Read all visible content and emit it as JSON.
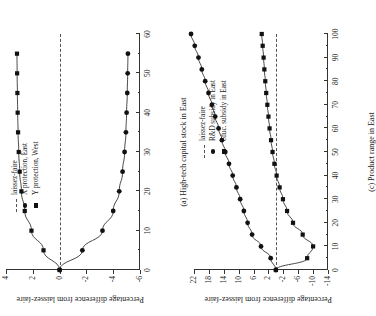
{
  "figure": {
    "shared_ylabel": "Percentage difference from laissez-faire"
  },
  "chart_data": [
    {
      "type": "line",
      "panel": "a",
      "title": "(a) High-tech capital stock in East",
      "xlabel": "(a) High-tech capital stock in East",
      "ylabel": "Percentage difference from laissez-faire",
      "xlim": [
        0,
        60
      ],
      "ylim": [
        -6,
        4
      ],
      "xticks": [
        0,
        10,
        20,
        30,
        40,
        50,
        60
      ],
      "xticklabels": [
        "0",
        "10",
        "20",
        "30",
        "40",
        "50",
        "60"
      ],
      "xminor_step": 5,
      "yticks": [
        -6,
        -4,
        -2,
        0,
        2,
        4
      ],
      "yticklabels": [
        "-6",
        "-4",
        "-2",
        "0",
        "2",
        "4"
      ],
      "grid": false,
      "legend_position": "upper-right-inside",
      "reference_line": {
        "label": "laissez-faire",
        "y": 0,
        "style": "dashed"
      },
      "series": [
        {
          "name": "X protection, East",
          "marker": "circle",
          "x": [
            0,
            5,
            10,
            15,
            20,
            25,
            30,
            35,
            40,
            45,
            50,
            55
          ],
          "y": [
            0.0,
            -1.7,
            -3.2,
            -4.0,
            -4.45,
            -4.7,
            -4.85,
            -4.95,
            -5.0,
            -5.05,
            -5.08,
            -5.1
          ]
        },
        {
          "name": "Y protection, West",
          "marker": "square",
          "x": [
            0,
            5,
            10,
            15,
            20,
            25,
            30,
            35,
            40,
            45,
            50,
            55
          ],
          "y": [
            0.0,
            1.2,
            2.1,
            2.6,
            2.85,
            2.98,
            3.05,
            3.1,
            3.13,
            3.15,
            3.17,
            3.18
          ]
        }
      ]
    },
    {
      "type": "line",
      "panel": "c",
      "title": "(c) Product range in East",
      "xlabel": "(c) Product range in East",
      "ylabel": "Percentage difference from laissez-faire",
      "xlim": [
        0,
        100
      ],
      "ylim": [
        -14,
        22
      ],
      "xticks": [
        0,
        10,
        20,
        30,
        40,
        50,
        60,
        70,
        80,
        90,
        100
      ],
      "xticklabels": [
        "0",
        "10",
        "20",
        "30",
        "40",
        "50",
        "60",
        "70",
        "80",
        "90",
        "100"
      ],
      "xminor_step": 5,
      "yticks": [
        -14,
        -10,
        -6,
        -2,
        2,
        6,
        10,
        14,
        18,
        22
      ],
      "yticklabels": [
        "-14",
        "-10",
        "-6",
        "-2",
        "2",
        "6",
        "10",
        "14",
        "18",
        "22"
      ],
      "grid": false,
      "legend_position": "upper-right-inside",
      "reference_line": {
        "label": "laissez-faire",
        "y": 0,
        "style": "dashed"
      },
      "series": [
        {
          "name": "R&D subsidy in East",
          "marker": "circle",
          "x": [
            0,
            5,
            10,
            15,
            20,
            25,
            30,
            35,
            40,
            45,
            50,
            55,
            60,
            65,
            70,
            75,
            80,
            85,
            90,
            95,
            100
          ],
          "y": [
            0.0,
            1.4,
            4.0,
            6.4,
            7.6,
            8.6,
            9.6,
            10.6,
            11.6,
            12.6,
            13.6,
            14.5,
            15.4,
            16.3,
            17.2,
            18.1,
            19.0,
            19.9,
            20.8,
            21.8,
            22.8
          ]
        },
        {
          "name": "educ. subsidy in East",
          "marker": "square",
          "x": [
            0,
            5,
            10,
            15,
            20,
            25,
            30,
            35,
            40,
            45,
            50,
            55,
            60,
            65,
            70,
            75,
            80,
            85,
            90,
            95,
            100
          ],
          "y": [
            0.0,
            -8.4,
            -10.0,
            -7.2,
            -4.6,
            -3.0,
            -1.9,
            -1.0,
            -0.2,
            0.4,
            0.9,
            1.3,
            1.7,
            2.0,
            2.3,
            2.6,
            2.85,
            3.1,
            3.3,
            3.55,
            3.8
          ]
        }
      ]
    }
  ],
  "panel_a": {
    "xlabel": "(a) High-tech capital stock in East",
    "ylabel": "Percentage difference from laissez-faire",
    "legend": {
      "items": [
        {
          "key": "dash",
          "label": "laissez-faire"
        },
        {
          "key": "circle",
          "label": "X protection, East"
        },
        {
          "key": "square",
          "label": "Y protection, West"
        }
      ]
    }
  },
  "panel_c": {
    "xlabel": "(c) Product range in East",
    "ylabel": "Percentage difference from laissez-faire",
    "legend": {
      "items": [
        {
          "key": "dash",
          "label": "laissez-faire"
        },
        {
          "key": "circle",
          "label": "R&D subsidy in East"
        },
        {
          "key": "square",
          "label": "educ. subsidy in East"
        }
      ]
    }
  },
  "colors": {
    "ink": "#1a1a1a",
    "axis": "#333333",
    "marker": "#111111",
    "dashed": "#555555",
    "background": "#ffffff"
  }
}
